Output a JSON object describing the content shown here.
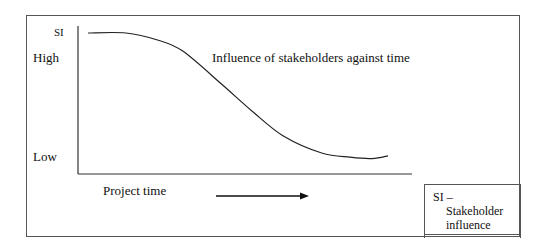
{
  "diagram": {
    "title": "Influence of stakeholders against time",
    "y_axis": {
      "abbrev": "SI",
      "high_label": "High",
      "low_label": "Low"
    },
    "x_axis": {
      "label": "Project time",
      "direction_icon": "right-arrow-icon"
    },
    "legend": {
      "line1": "SI –",
      "line2": "Stakeholder",
      "line3": "influence"
    }
  },
  "chart_data": {
    "type": "line",
    "title": "Influence of stakeholders against time",
    "xlabel": "Project time",
    "ylabel": "SI",
    "y_ticks": [
      "Low",
      "High"
    ],
    "xlim": [
      0,
      1
    ],
    "ylim": [
      0,
      1
    ],
    "grid": false,
    "legend": "bottom-right",
    "series": [
      {
        "name": "Stakeholder influence",
        "x": [
          0.0,
          0.12,
          0.22,
          0.3,
          0.42,
          0.52,
          0.62,
          0.74,
          0.83,
          0.9,
          0.95
        ],
        "y": [
          0.96,
          0.96,
          0.91,
          0.83,
          0.6,
          0.4,
          0.22,
          0.1,
          0.07,
          0.06,
          0.08
        ]
      }
    ]
  }
}
